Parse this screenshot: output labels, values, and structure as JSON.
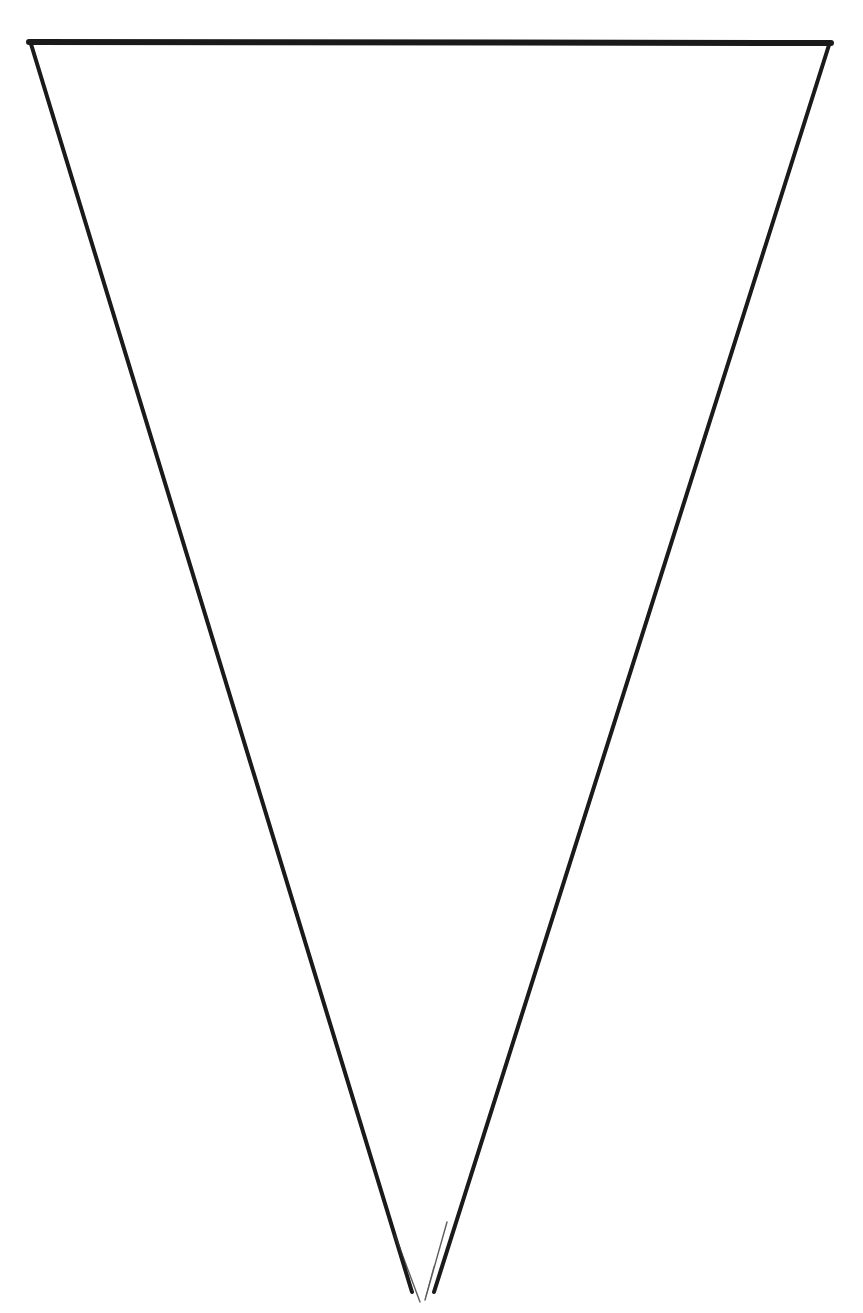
{
  "figure": {
    "background_color": "#ffffff",
    "stroke_color": "#1a1a1a",
    "top_stroke_width": 6,
    "side_stroke_width": 4,
    "vertices": {
      "top_left": [
        29,
        42
      ],
      "top_right": [
        831,
        43
      ],
      "apex": [
        422,
        1300
      ]
    }
  }
}
